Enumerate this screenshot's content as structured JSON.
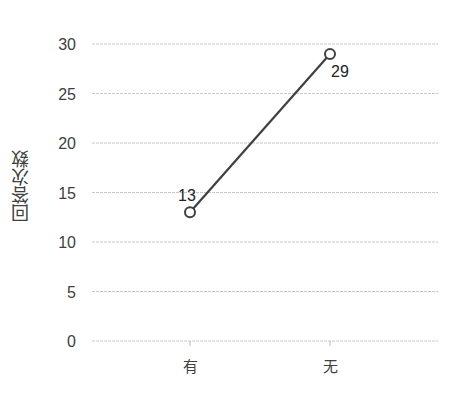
{
  "chart_data": {
    "type": "line",
    "title": "",
    "xlabel": "",
    "ylabel": "回答次数",
    "categories": [
      "有",
      "无"
    ],
    "series": [
      {
        "name": "回答次数",
        "values": [
          13,
          29
        ],
        "color": "#404040"
      }
    ],
    "data_labels": [
      "13",
      "29"
    ],
    "ylim": [
      0,
      30
    ],
    "yticks": [
      0,
      5,
      10,
      15,
      20,
      25,
      30
    ],
    "grid": true,
    "legend": "none",
    "marker": "hollow-circle"
  },
  "labels": {
    "ylabel": "回答次数"
  }
}
